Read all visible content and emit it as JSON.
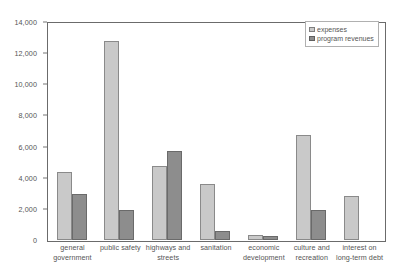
{
  "chart_data": {
    "type": "bar",
    "title": "",
    "xlabel": "",
    "ylabel": "",
    "ylim": [
      0,
      14000
    ],
    "ytick_labels": [
      "14,000",
      "12,000",
      "10,000",
      "8,000",
      "6,000",
      "4,000",
      "2,000",
      "0"
    ],
    "ytick_values": [
      14000,
      12000,
      10000,
      8000,
      6000,
      4000,
      2000,
      0
    ],
    "grid": false,
    "legend_position": "top-right",
    "categories": [
      "general government",
      "public safety",
      "highways and streets",
      "sanitation",
      "economic development",
      "culture and recreation",
      "interest on long-term debt"
    ],
    "series": [
      {
        "name": "expenses",
        "color": "#c9c9c9",
        "values": [
          4350,
          12800,
          4750,
          3600,
          350,
          6750,
          2800
        ]
      },
      {
        "name": "program revenues",
        "color": "#8d8d8d",
        "values": [
          2950,
          1950,
          5700,
          550,
          250,
          1950,
          0
        ]
      }
    ]
  },
  "legend": {
    "items": [
      {
        "label": "expenses"
      },
      {
        "label": "program revenues"
      }
    ]
  }
}
